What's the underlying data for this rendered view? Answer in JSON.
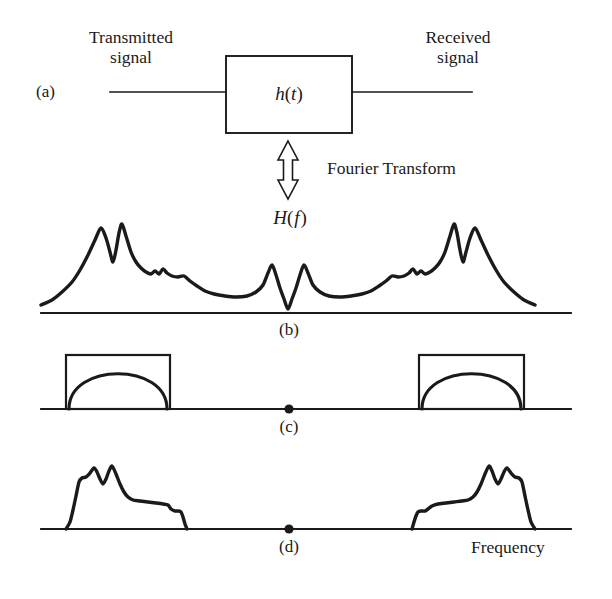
{
  "figure": {
    "ink_color": "#1a1a1a",
    "background": "#ffffff"
  },
  "panel_a": {
    "tag": "(a)",
    "input_label_line1": "Transmitted",
    "input_label_line2": "signal",
    "output_label_line1": "Received",
    "output_label_line2": "signal",
    "block_label_h": "h",
    "block_label_paren_open": "(",
    "block_label_t": "t",
    "block_label_paren_close": ")",
    "block_label_full": "h(t)"
  },
  "transform": {
    "arrow_label": "Fourier Transform",
    "arrow_type": "double-headed-vertical-hollow"
  },
  "panel_b": {
    "tag": "(b)",
    "curve_label_H": "H",
    "curve_label_paren_open": "(",
    "curve_label_f": "f",
    "curve_label_paren_close": ")",
    "curve_label_full": "H(f)"
  },
  "panel_c": {
    "tag": "(c)"
  },
  "panel_d": {
    "tag": "(d)"
  },
  "axis": {
    "frequency_label": "Frequency"
  },
  "chart_data": {
    "type": "line",
    "title": "H(f)",
    "xlabel": "Frequency",
    "ylabel": "",
    "panels": [
      {
        "id": "b",
        "tag": "(b)",
        "label": "H(f)",
        "description": "Channel frequency response magnitude, symmetric about center null",
        "baseline_y": 313,
        "x_range": [
          41,
          571
        ],
        "series": [
          {
            "name": "H(f)",
            "points": [
              [
                41,
                305
              ],
              [
                52,
                300
              ],
              [
                62,
                292
              ],
              [
                72,
                282
              ],
              [
                80,
                270
              ],
              [
                88,
                255
              ],
              [
                95,
                240
              ],
              [
                101,
                228
              ],
              [
                106,
                238
              ],
              [
                110,
                252
              ],
              [
                113,
                262
              ],
              [
                116,
                250
              ],
              [
                119,
                233
              ],
              [
                122,
                224
              ],
              [
                126,
                236
              ],
              [
                131,
                252
              ],
              [
                136,
                262
              ],
              [
                141,
                268
              ],
              [
                146,
                272
              ],
              [
                151,
                274
              ],
              [
                155,
                271
              ],
              [
                159,
                274
              ],
              [
                163,
                269
              ],
              [
                167,
                273
              ],
              [
                172,
                276
              ],
              [
                178,
                277
              ],
              [
                184,
                276
              ],
              [
                190,
                281
              ],
              [
                197,
                286
              ],
              [
                205,
                291
              ],
              [
                214,
                294
              ],
              [
                225,
                296
              ],
              [
                236,
                297
              ],
              [
                247,
                296
              ],
              [
                256,
                292
              ],
              [
                263,
                285
              ],
              [
                268,
                273
              ],
              [
                272,
                265
              ],
              [
                276,
                275
              ],
              [
                280,
                288
              ],
              [
                284,
                299
              ],
              [
                288,
                309
              ],
              [
                292,
                299
              ],
              [
                296,
                288
              ],
              [
                300,
                275
              ],
              [
                304,
                265
              ],
              [
                308,
                273
              ],
              [
                313,
                285
              ],
              [
                320,
                292
              ],
              [
                329,
                296
              ],
              [
                340,
                297
              ],
              [
                351,
                296
              ],
              [
                362,
                294
              ],
              [
                371,
                291
              ],
              [
                379,
                286
              ],
              [
                386,
                281
              ],
              [
                392,
                276
              ],
              [
                398,
                277
              ],
              [
                404,
                276
              ],
              [
                409,
                273
              ],
              [
                413,
                269
              ],
              [
                417,
                274
              ],
              [
                421,
                271
              ],
              [
                425,
                274
              ],
              [
                430,
                272
              ],
              [
                435,
                268
              ],
              [
                440,
                262
              ],
              [
                445,
                252
              ],
              [
                450,
                236
              ],
              [
                454,
                224
              ],
              [
                457,
                233
              ],
              [
                460,
                250
              ],
              [
                463,
                262
              ],
              [
                466,
                252
              ],
              [
                470,
                238
              ],
              [
                475,
                228
              ],
              [
                481,
                240
              ],
              [
                488,
                255
              ],
              [
                496,
                270
              ],
              [
                504,
                282
              ],
              [
                514,
                292
              ],
              [
                524,
                300
              ],
              [
                535,
                305
              ]
            ]
          }
        ]
      },
      {
        "id": "c",
        "tag": "(c)",
        "description": "Two transmission passbands: rectangle outline with inscribed semicircular arc",
        "baseline_y": 409,
        "x_range": [
          41,
          571
        ],
        "blocks": [
          {
            "x_left": 66,
            "x_right": 170,
            "y_top": 355,
            "shape": "rect+arc"
          },
          {
            "x_left": 419,
            "x_right": 524,
            "y_top": 355,
            "shape": "rect+arc"
          }
        ],
        "center_dot": {
          "x": 289,
          "y": 409
        }
      },
      {
        "id": "d",
        "tag": "(d)",
        "description": "Received signal spectrum: product of channel response and passbands",
        "baseline_y": 529,
        "x_range": [
          41,
          571
        ],
        "center_dot": {
          "x": 289,
          "y": 529
        },
        "series": [
          {
            "name": "left-band",
            "points": [
              [
                66,
                529
              ],
              [
                70,
                522
              ],
              [
                73,
                510
              ],
              [
                76,
                496
              ],
              [
                79,
                482
              ],
              [
                82,
                478
              ],
              [
                86,
                477
              ],
              [
                90,
                473
              ],
              [
                94,
                468
              ],
              [
                97,
                472
              ],
              [
                100,
                479
              ],
              [
                103,
                484
              ],
              [
                106,
                479
              ],
              [
                109,
                471
              ],
              [
                112,
                466
              ],
              [
                116,
                474
              ],
              [
                120,
                484
              ],
              [
                124,
                492
              ],
              [
                128,
                497
              ],
              [
                133,
                500
              ],
              [
                140,
                501
              ],
              [
                148,
                502
              ],
              [
                156,
                503
              ],
              [
                163,
                504
              ],
              [
                168,
                505
              ],
              [
                171,
                509
              ],
              [
                175,
                511
              ],
              [
                178,
                511
              ],
              [
                181,
                512
              ],
              [
                183,
                517
              ],
              [
                185,
                524
              ],
              [
                187,
                529
              ]
            ]
          },
          {
            "name": "right-band",
            "points": [
              [
                412,
                529
              ],
              [
                414,
                522
              ],
              [
                416,
                516
              ],
              [
                418,
                512
              ],
              [
                421,
                511
              ],
              [
                425,
                511
              ],
              [
                428,
                509
              ],
              [
                432,
                506
              ],
              [
                438,
                504
              ],
              [
                446,
                503
              ],
              [
                454,
                502
              ],
              [
                462,
                501
              ],
              [
                468,
                500
              ],
              [
                473,
                497
              ],
              [
                477,
                492
              ],
              [
                481,
                484
              ],
              [
                485,
                474
              ],
              [
                489,
                466
              ],
              [
                492,
                471
              ],
              [
                495,
                479
              ],
              [
                498,
                484
              ],
              [
                501,
                479
              ],
              [
                504,
                472
              ],
              [
                507,
                468
              ],
              [
                511,
                473
              ],
              [
                515,
                477
              ],
              [
                519,
                478
              ],
              [
                522,
                482
              ],
              [
                525,
                496
              ],
              [
                528,
                510
              ],
              [
                531,
                522
              ],
              [
                535,
                529
              ]
            ]
          }
        ]
      }
    ]
  },
  "geometry": {
    "panel_a_line_left_start": 110,
    "panel_a_line_right_end": 472,
    "panel_a_line_y": 92,
    "block_left": 226,
    "block_right": 352,
    "block_top": 56,
    "block_bottom": 133,
    "arrow_center_x": 288,
    "arrow_top": 143,
    "arrow_bottom": 197
  }
}
